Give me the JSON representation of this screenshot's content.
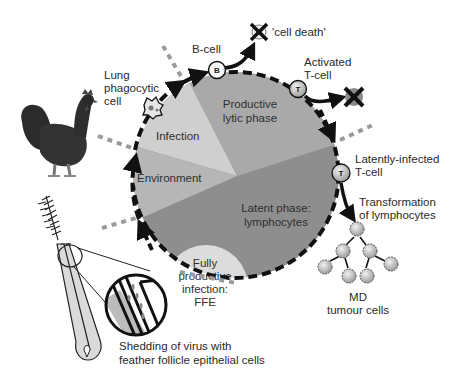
{
  "diagram": {
    "colors": {
      "background": "#ffffff",
      "infection": "#cfcfcf",
      "productive_lytic": "#a9a9a9",
      "environment": "#b6b6b6",
      "latent": "#8e8e8e",
      "ffe": "#dcdcdc",
      "cycle_dash": "#111111",
      "route_dash": "#9a9a9a",
      "cell_fill": "#c8c8c8",
      "text": "#2a2a2a"
    },
    "segments": [
      {
        "id": "infection",
        "label": "Infection"
      },
      {
        "id": "productive",
        "label_lines": [
          "Productive",
          "lytic phase"
        ]
      },
      {
        "id": "environment",
        "label": "Environment"
      },
      {
        "id": "latent",
        "label_lines": [
          "Latent phase:",
          "lymphocytes"
        ]
      },
      {
        "id": "ffe",
        "label_lines": [
          "Fully",
          "productive",
          "infection:",
          "FFE"
        ]
      }
    ],
    "outer_labels": {
      "lung_cell": [
        "Lung",
        "phagocytic",
        "cell"
      ],
      "b_cell": "B-cell",
      "cell_death": "'cell death'",
      "activated_t": [
        "Activated",
        "T-cell"
      ],
      "latent_t": [
        "Latently-infected",
        "T-cell"
      ],
      "transformation": [
        "Transformation",
        "of lymphocytes"
      ],
      "tumour": [
        "MD",
        "tumour cells"
      ],
      "shedding": [
        "Shedding of virus with",
        "feather follicle epithelial cells"
      ]
    },
    "cell_markers": {
      "b": "B",
      "t_activated": "T",
      "t_latent": "T"
    },
    "icons": {
      "chicken": "rooster-illustration",
      "feather": "feather-follicle-illustration",
      "magnifier": "magnified-follicle-inset",
      "death": "crossed-cell-icon",
      "tumour_cell": "spiky-tumour-cell-icon"
    }
  }
}
